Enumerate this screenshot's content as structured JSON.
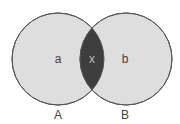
{
  "diagram": {
    "type": "venn",
    "sets": [
      {
        "name": "A",
        "region_label": "a",
        "cx": 58,
        "cy": 59,
        "r": 46
      },
      {
        "name": "B",
        "region_label": "b",
        "cx": 126,
        "cy": 59,
        "r": 46
      }
    ],
    "intersection_label": "x",
    "colors": {
      "circle_fill": "#dedede",
      "intersection_fill": "#3e3e3e",
      "stroke": "#555555"
    }
  }
}
